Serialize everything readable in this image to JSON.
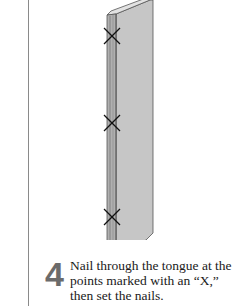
{
  "step": {
    "number": "4",
    "text": "Nail through the tongue at the points marked with an “X,” then set the nails."
  },
  "illustration": {
    "subject": "tongue-and-groove board",
    "nail_marks": 3,
    "mark_glyph": "X",
    "colors": {
      "board_face": "#c4c4c4",
      "board_edge": "#a8a8a8",
      "outline": "#4a4a4a",
      "mark": "#111111"
    }
  }
}
